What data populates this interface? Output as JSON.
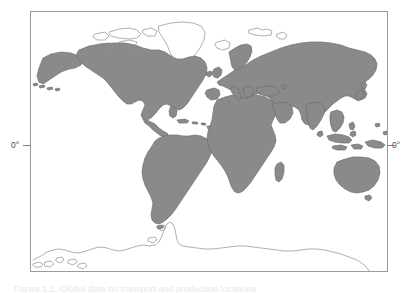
{
  "figure": {
    "type": "world-map",
    "projection": "equirectangular",
    "caption": "Figure 1.1: Global data on transport and production locations",
    "frame": {
      "left": 30,
      "top": 11,
      "width": 358,
      "height": 261,
      "border_color": "#9a9a9a"
    },
    "colors": {
      "land_fill": "#8a8a8a",
      "land_stroke": "#6e6e6e",
      "outline_only_stroke": "#8e8e8e",
      "frame": "#9a9a9a",
      "tick": "#7d7d7d",
      "label_text": "#4a4a4a",
      "background": "#ffffff"
    },
    "axis": {
      "equator": {
        "left_label": "0°",
        "right_label": "0°",
        "y_position": 145
      }
    },
    "legend": {
      "filled_regions": "land (shaded)",
      "outlined_regions": "Greenland, Canadian Arctic, Antarctica (outline only)"
    },
    "regions": [
      "North America",
      "South America",
      "Greenland",
      "Canadian Arctic Islands",
      "Iceland",
      "Europe",
      "Africa",
      "Madagascar",
      "Asia",
      "Japan",
      "Indonesia",
      "Philippines",
      "Australia",
      "New Zealand",
      "Antarctica",
      "Svalbard",
      "British Isles"
    ]
  }
}
